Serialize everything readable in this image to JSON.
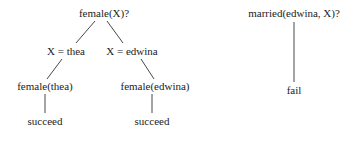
{
  "diagram": {
    "type": "resolution-trees",
    "trees": [
      {
        "root": "female(X)?",
        "branches": [
          {
            "binding": "X = thea",
            "goal": "female(thea)",
            "result": "succeed"
          },
          {
            "binding": "X = edwina",
            "goal": "female(edwina)",
            "result": "succeed"
          }
        ]
      },
      {
        "root": "married(edwina, X)?",
        "result": "fail"
      }
    ]
  },
  "colors": {
    "text": "#222222",
    "edge": "#333333",
    "background": "#ffffff"
  }
}
